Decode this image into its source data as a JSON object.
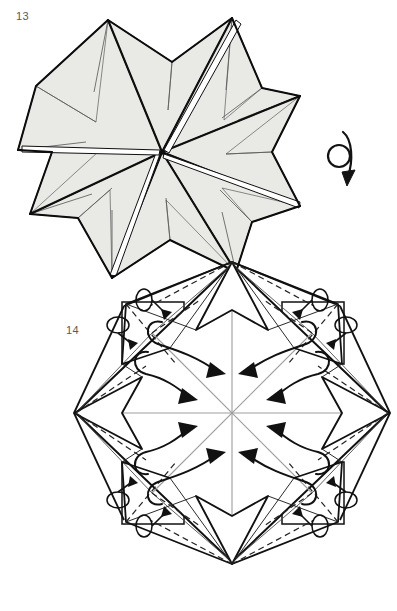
{
  "page": {
    "kind": "origami-instruction-diagram",
    "background_color": "#ffffff",
    "width": 397,
    "height": 611
  },
  "steps": [
    {
      "number": "13",
      "label_position": {
        "x": 16,
        "y": 11
      },
      "figure_name": "eight-pointed-star-shaded",
      "description": "Shaded eight-pointed star form seen from above with creases radiating to the centre",
      "paper_fill": "#e9e9e6",
      "outline_color": "#111111",
      "crease_color": "#3a3a3a",
      "center": {
        "x": 162,
        "y": 152
      },
      "points": 8,
      "outer_radius": 145,
      "inner_radius": 66
    },
    {
      "number": "14",
      "label_position": {
        "x": 66,
        "y": 325
      },
      "figure_name": "diamond-base-with-fold-arrows",
      "description": "Square diamond base with four corner flaps, valley fold dashes and eight curled fold-over arrows",
      "paper_fill": "#ffffff",
      "outline_color": "#111111",
      "valley_fold_color": "#222222",
      "axis_color": "#9a9a9a",
      "center": {
        "x": 232,
        "y": 413
      },
      "half_diagonal": 168,
      "arrow_count": 8,
      "rotation_loop_count": 8
    }
  ],
  "symbols": [
    {
      "name": "turn-over-arrow",
      "meaning": "turn the model over",
      "position": {
        "x": 340,
        "y": 155
      },
      "circle_radius": 11,
      "color": "#111111"
    }
  ],
  "colors": {
    "paper_shade": "#e9e9e6",
    "ink": "#111111",
    "soft_crease": "#3d3d3d",
    "axis_gray": "#9a9a9a",
    "step_number": "#5a5a5a",
    "background": "#ffffff"
  }
}
